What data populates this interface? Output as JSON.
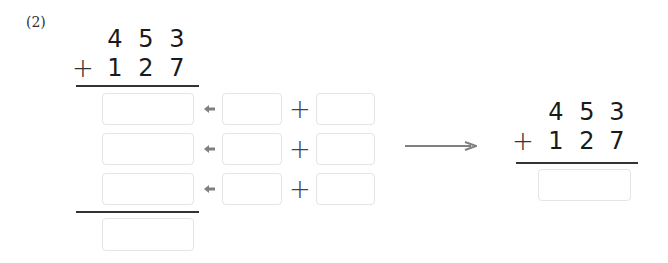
{
  "problem": {
    "label": "(2)",
    "addend1": [
      "4",
      "5",
      "3"
    ],
    "operator": "+",
    "addend2": [
      "1",
      "2",
      "7"
    ]
  },
  "expanded": {
    "rows": [
      {
        "result": "",
        "left": "",
        "right": ""
      },
      {
        "result": "",
        "left": "",
        "right": ""
      },
      {
        "result": "",
        "left": "",
        "right": ""
      }
    ],
    "plus_symbol": "+",
    "total": ""
  },
  "vertical": {
    "addend1": [
      "4",
      "5",
      "3"
    ],
    "operator": "+",
    "addend2": [
      "1",
      "2",
      "7"
    ],
    "answer": ""
  },
  "colors": {
    "arrow": "#808080",
    "box_border": "#e4e4e4",
    "text": "#1a1a1a"
  }
}
